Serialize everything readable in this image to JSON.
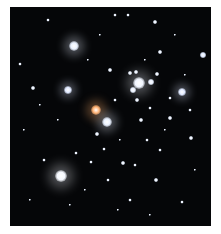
{
  "image": {
    "subject": "star cluster",
    "background_color": "#050608",
    "frame_color": "#ffffff"
  },
  "stars": [
    {
      "x": 74,
      "y": 46,
      "r": 5,
      "c": "#e8f0ff",
      "glow": 1
    },
    {
      "x": 68,
      "y": 90,
      "r": 4,
      "c": "#dfe8ff",
      "glow": 1
    },
    {
      "x": 96,
      "y": 110,
      "r": 5,
      "c": "#ffb070",
      "glow": 1
    },
    {
      "x": 107,
      "y": 122,
      "r": 5,
      "c": "#e8f0ff",
      "glow": 1
    },
    {
      "x": 139,
      "y": 83,
      "r": 6,
      "c": "#f0f5ff",
      "glow": 1
    },
    {
      "x": 133,
      "y": 90,
      "r": 3,
      "c": "#e8f0ff",
      "glow": 0
    },
    {
      "x": 151,
      "y": 82,
      "r": 3,
      "c": "#e8f0ff",
      "glow": 0
    },
    {
      "x": 182,
      "y": 92,
      "r": 4,
      "c": "#dfe8ff",
      "glow": 1
    },
    {
      "x": 61,
      "y": 176,
      "r": 6,
      "c": "#f5f8ff",
      "glow": 1
    },
    {
      "x": 203,
      "y": 55,
      "r": 3,
      "c": "#dfe8ff",
      "glow": 0
    },
    {
      "x": 130,
      "y": 73,
      "r": 2,
      "c": "#e8f0ff",
      "glow": 0
    },
    {
      "x": 136,
      "y": 72,
      "r": 2,
      "c": "#e8f0ff",
      "glow": 0
    },
    {
      "x": 157,
      "y": 74,
      "r": 2,
      "c": "#e8f0ff",
      "glow": 0
    },
    {
      "x": 110,
      "y": 70,
      "r": 2,
      "c": "#e8f0ff",
      "glow": 0
    },
    {
      "x": 33,
      "y": 88,
      "r": 2,
      "c": "#e8f0ff",
      "glow": 0
    },
    {
      "x": 155,
      "y": 22,
      "r": 2,
      "c": "#e8f0ff",
      "glow": 0
    },
    {
      "x": 115,
      "y": 15,
      "r": 1.5,
      "c": "#e8f0ff",
      "glow": 0
    },
    {
      "x": 128,
      "y": 15,
      "r": 1.5,
      "c": "#e8f0ff",
      "glow": 0
    },
    {
      "x": 160,
      "y": 52,
      "r": 2,
      "c": "#e8f0ff",
      "glow": 0
    },
    {
      "x": 137,
      "y": 100,
      "r": 2,
      "c": "#e8f0ff",
      "glow": 0
    },
    {
      "x": 141,
      "y": 120,
      "r": 2,
      "c": "#e8f0ff",
      "glow": 0
    },
    {
      "x": 170,
      "y": 118,
      "r": 2,
      "c": "#e8f0ff",
      "glow": 0
    },
    {
      "x": 191,
      "y": 138,
      "r": 2,
      "c": "#e8f0ff",
      "glow": 0
    },
    {
      "x": 156,
      "y": 180,
      "r": 2,
      "c": "#e8f0ff",
      "glow": 0
    },
    {
      "x": 123,
      "y": 163,
      "r": 2,
      "c": "#e8f0ff",
      "glow": 0
    },
    {
      "x": 135,
      "y": 165,
      "r": 1.5,
      "c": "#e8f0ff",
      "glow": 0
    },
    {
      "x": 97,
      "y": 134,
      "r": 2,
      "c": "#e8f0ff",
      "glow": 0
    },
    {
      "x": 104,
      "y": 149,
      "r": 1.5,
      "c": "#e8f0ff",
      "glow": 0
    },
    {
      "x": 91,
      "y": 162,
      "r": 1.5,
      "c": "#e8f0ff",
      "glow": 0
    },
    {
      "x": 76,
      "y": 153,
      "r": 1.5,
      "c": "#e8f0ff",
      "glow": 0
    },
    {
      "x": 44,
      "y": 160,
      "r": 1.5,
      "c": "#e8f0ff",
      "glow": 0
    },
    {
      "x": 20,
      "y": 64,
      "r": 1.5,
      "c": "#e8f0ff",
      "glow": 0
    },
    {
      "x": 48,
      "y": 20,
      "r": 1.5,
      "c": "#e8f0ff",
      "glow": 0
    },
    {
      "x": 182,
      "y": 202,
      "r": 1.5,
      "c": "#e8f0ff",
      "glow": 0
    },
    {
      "x": 190,
      "y": 110,
      "r": 1.5,
      "c": "#e8f0ff",
      "glow": 0
    },
    {
      "x": 170,
      "y": 98,
      "r": 1.5,
      "c": "#e8f0ff",
      "glow": 0
    },
    {
      "x": 147,
      "y": 140,
      "r": 1.5,
      "c": "#e8f0ff",
      "glow": 0
    },
    {
      "x": 160,
      "y": 150,
      "r": 1.5,
      "c": "#e8f0ff",
      "glow": 0
    },
    {
      "x": 108,
      "y": 180,
      "r": 1.5,
      "c": "#e8f0ff",
      "glow": 0
    },
    {
      "x": 130,
      "y": 200,
      "r": 1.5,
      "c": "#e8f0ff",
      "glow": 0
    },
    {
      "x": 70,
      "y": 205,
      "r": 1.2,
      "c": "#e8f0ff",
      "glow": 0
    },
    {
      "x": 30,
      "y": 200,
      "r": 1.2,
      "c": "#e8f0ff",
      "glow": 0
    },
    {
      "x": 24,
      "y": 130,
      "r": 1.2,
      "c": "#e8f0ff",
      "glow": 0
    },
    {
      "x": 88,
      "y": 60,
      "r": 1.2,
      "c": "#e8f0ff",
      "glow": 0
    },
    {
      "x": 100,
      "y": 35,
      "r": 1.2,
      "c": "#e8f0ff",
      "glow": 0
    },
    {
      "x": 175,
      "y": 35,
      "r": 1.2,
      "c": "#e8f0ff",
      "glow": 0
    },
    {
      "x": 195,
      "y": 170,
      "r": 1.2,
      "c": "#e8f0ff",
      "glow": 0
    },
    {
      "x": 115,
      "y": 100,
      "r": 1.5,
      "c": "#e8f0ff",
      "glow": 0
    },
    {
      "x": 150,
      "y": 108,
      "r": 1.5,
      "c": "#e8f0ff",
      "glow": 0
    },
    {
      "x": 120,
      "y": 140,
      "r": 1.2,
      "c": "#e8f0ff",
      "glow": 0
    },
    {
      "x": 58,
      "y": 120,
      "r": 1.2,
      "c": "#e8f0ff",
      "glow": 0
    },
    {
      "x": 40,
      "y": 105,
      "r": 1.2,
      "c": "#e8f0ff",
      "glow": 0
    },
    {
      "x": 165,
      "y": 130,
      "r": 1.2,
      "c": "#e8f0ff",
      "glow": 0
    },
    {
      "x": 145,
      "y": 60,
      "r": 1.2,
      "c": "#e8f0ff",
      "glow": 0
    },
    {
      "x": 185,
      "y": 75,
      "r": 1.2,
      "c": "#e8f0ff",
      "glow": 0
    },
    {
      "x": 85,
      "y": 190,
      "r": 1.2,
      "c": "#e8f0ff",
      "glow": 0
    },
    {
      "x": 118,
      "y": 210,
      "r": 1.2,
      "c": "#e8f0ff",
      "glow": 0
    },
    {
      "x": 150,
      "y": 215,
      "r": 1.2,
      "c": "#e8f0ff",
      "glow": 0
    }
  ]
}
